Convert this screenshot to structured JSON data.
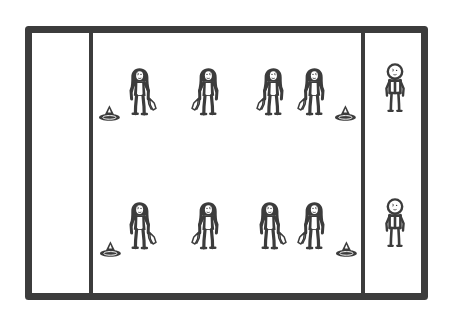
{
  "diagram": {
    "style": {
      "ink_color": "#3c3c3c",
      "background_color": "#ffffff",
      "outer_border_width": 7,
      "divider_width": 4
    },
    "court": {
      "name": "court-outline",
      "x": 25,
      "y": 26,
      "width": 403,
      "height": 274,
      "lanes": [
        {
          "name": "left-lane",
          "x1": 25,
          "x2": 91,
          "label": ""
        },
        {
          "name": "centre-lane",
          "x1": 91,
          "x2": 363,
          "label": ""
        },
        {
          "name": "right-lane",
          "x1": 363,
          "x2": 428,
          "label": ""
        }
      ],
      "dividers": [
        {
          "name": "left-divider",
          "x": 91
        },
        {
          "name": "right-divider",
          "x": 363
        }
      ]
    },
    "rows": [
      {
        "name": "top-row",
        "y": 63,
        "cones": [
          {
            "name": "cone-top-left",
            "x": 109,
            "y": 113
          },
          {
            "name": "cone-top-right",
            "x": 345,
            "y": 113
          }
        ],
        "figures": [
          {
            "name": "figure-top-1",
            "type": "long-hair-with-gear",
            "x": 142,
            "y": 66,
            "gear_hand": "right"
          },
          {
            "name": "figure-top-2",
            "type": "long-hair-with-gear",
            "x": 207,
            "y": 66,
            "gear_hand": "left"
          },
          {
            "name": "figure-top-3",
            "type": "long-hair-with-gear",
            "x": 272,
            "y": 66,
            "gear_hand": "left"
          },
          {
            "name": "figure-top-4",
            "type": "long-hair-with-gear",
            "x": 313,
            "y": 66,
            "gear_hand": "left"
          }
        ],
        "sideline_figure": {
          "name": "figure-top-right-lane",
          "type": "plain-stick",
          "x": 394,
          "y": 62
        }
      },
      {
        "name": "bottom-row",
        "y": 198,
        "cones": [
          {
            "name": "cone-bottom-left",
            "x": 110,
            "y": 249
          },
          {
            "name": "cone-bottom-right",
            "x": 346,
            "y": 249
          }
        ],
        "figures": [
          {
            "name": "figure-bottom-1",
            "type": "long-hair-with-gear",
            "x": 142,
            "y": 200,
            "gear_hand": "right"
          },
          {
            "name": "figure-bottom-2",
            "type": "long-hair-with-gear",
            "x": 207,
            "y": 200,
            "gear_hand": "left"
          },
          {
            "name": "figure-bottom-3",
            "type": "long-hair-with-gear",
            "x": 272,
            "y": 200,
            "gear_hand": "right"
          },
          {
            "name": "figure-bottom-4",
            "type": "long-hair-with-gear",
            "x": 313,
            "y": 200,
            "gear_hand": "left"
          }
        ],
        "sideline_figure": {
          "name": "figure-bottom-right-lane",
          "type": "plain-stick",
          "x": 394,
          "y": 197
        }
      }
    ],
    "counts": {
      "figures_with_gear": 8,
      "plain_figures": 2,
      "cones": 4,
      "lanes": 3
    }
  }
}
